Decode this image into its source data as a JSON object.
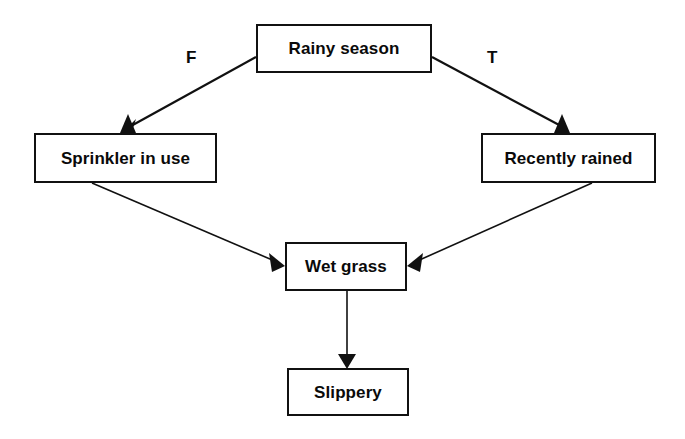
{
  "diagram": {
    "background_color": "#ffffff",
    "line_color": "#111111",
    "text_color": "#0a0a0a",
    "nodes": [
      {
        "id": "rainy_season",
        "label": "Rainy season"
      },
      {
        "id": "sprinkler_in_use",
        "label": "Sprinkler in use"
      },
      {
        "id": "recently_rained",
        "label": "Recently rained"
      },
      {
        "id": "wet_grass",
        "label": "Wet grass"
      },
      {
        "id": "slippery",
        "label": "Slippery"
      }
    ],
    "edges": [
      {
        "from": "rainy_season",
        "to": "sprinkler_in_use",
        "label": "F"
      },
      {
        "from": "rainy_season",
        "to": "recently_rained",
        "label": "T"
      },
      {
        "from": "sprinkler_in_use",
        "to": "wet_grass",
        "label": ""
      },
      {
        "from": "recently_rained",
        "to": "wet_grass",
        "label": ""
      },
      {
        "from": "wet_grass",
        "to": "slippery",
        "label": ""
      }
    ],
    "edge_labels": {
      "false_branch": "F",
      "true_branch": "T"
    }
  }
}
